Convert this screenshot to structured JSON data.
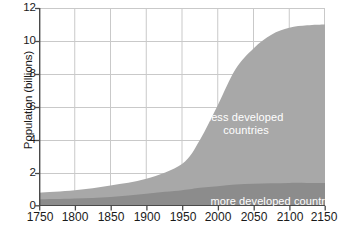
{
  "chart_data": {
    "type": "area",
    "stacked": true,
    "title": "",
    "xlabel": "",
    "ylabel": "Population (billions)",
    "xlim": [
      1750,
      2150
    ],
    "ylim": [
      0,
      12
    ],
    "x_ticks": [
      1750,
      1800,
      1850,
      1900,
      1950,
      2000,
      2050,
      2100,
      2150
    ],
    "y_ticks": [
      0,
      2,
      4,
      6,
      8,
      10,
      12
    ],
    "grid": true,
    "legend": "in-plot labels",
    "x": [
      1750,
      1800,
      1850,
      1900,
      1950,
      1975,
      2000,
      2025,
      2050,
      2075,
      2100,
      2125,
      2150
    ],
    "series": [
      {
        "name": "more developed countries",
        "color": "#8c8c8c",
        "values": [
          0.4,
          0.45,
          0.55,
          0.75,
          0.95,
          1.1,
          1.2,
          1.3,
          1.35,
          1.38,
          1.4,
          1.4,
          1.4
        ]
      },
      {
        "name": "less developed countries",
        "color": "#a8a8a8",
        "values": [
          0.4,
          0.5,
          0.7,
          0.9,
          1.6,
          2.9,
          4.9,
          7.0,
          8.2,
          9.0,
          9.4,
          9.55,
          9.6
        ]
      }
    ],
    "totals": [
      0.8,
      0.95,
      1.25,
      1.65,
      2.55,
      4.0,
      6.1,
      8.3,
      9.55,
      10.38,
      10.8,
      10.95,
      11.0
    ],
    "annotations": [
      {
        "name": "less-developed-label",
        "text": "less developed\ncountries"
      },
      {
        "name": "more-developed-label",
        "text": "more developed countries"
      }
    ],
    "colors": {
      "plot_background": "#ffffff",
      "grid": "#c9c9c9",
      "axis": "#4a4a4a",
      "text": "#1a1a1a",
      "annotation_text": "#ffffff",
      "more_developed": "#8c8c8c",
      "less_developed": "#a8a8a8"
    }
  },
  "axes": {
    "y_title": "Population (billions)",
    "y_tick_labels": [
      "12",
      "10",
      "8",
      "6",
      "4",
      "2",
      "0"
    ],
    "x_tick_labels": [
      "1750",
      "1800",
      "1850",
      "1900",
      "1950",
      "2000",
      "2050",
      "2100",
      "2150"
    ]
  },
  "annotations": {
    "less_developed_line1": "less developed",
    "less_developed_line2": "countries",
    "more_developed": "more developed countries"
  }
}
